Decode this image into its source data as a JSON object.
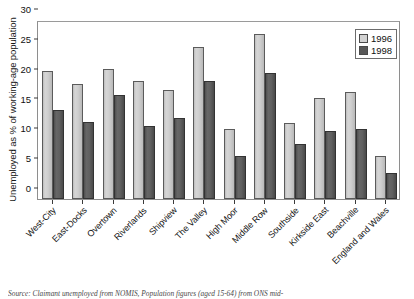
{
  "chart_data": {
    "type": "bar",
    "title": "",
    "xlabel": "",
    "ylabel": "Unemployed as % of working-age population",
    "ylim": [
      0,
      30
    ],
    "yticks": [
      0,
      5,
      10,
      15,
      20,
      25,
      30
    ],
    "grid": false,
    "legend_position": "top-right",
    "categories": [
      "West-City",
      "East-Docks",
      "Overtown",
      "Riverlands",
      "Shipview",
      "The Valley",
      "High Moor",
      "Middle Row",
      "Southside",
      "Kirkside East",
      "Beachville",
      "England and Wales"
    ],
    "series": [
      {
        "name": "1996",
        "color": "#d2d2d2",
        "values": [
          21.5,
          19.3,
          21.8,
          19.8,
          18.2,
          25.5,
          11.7,
          27.7,
          12.8,
          16.9,
          17.9,
          7.2
        ]
      },
      {
        "name": "1998",
        "color": "#585858",
        "values": [
          14.9,
          12.9,
          17.5,
          12.3,
          13.5,
          19.8,
          7.2,
          21.1,
          9.2,
          11.4,
          11.8,
          4.4
        ]
      }
    ]
  },
  "legend": {
    "entries": [
      {
        "label": "1996"
      },
      {
        "label": "1998"
      }
    ]
  },
  "source": {
    "text": "Source: Claimant unemployed from NOMIS, Population figures (aged 15-64) from ONS mid-"
  },
  "colors": {
    "series_1996": "#d2d2d2",
    "series_1998": "#585858",
    "axis": "#3a3a3a",
    "frame": "#8e8e8e",
    "text": "#141414"
  }
}
